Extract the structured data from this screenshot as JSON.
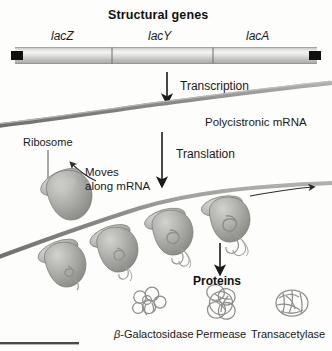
{
  "figure": {
    "title": "Structural genes",
    "genes": [
      {
        "label": "lacZ"
      },
      {
        "label": "lacY"
      },
      {
        "label": "lacA"
      }
    ],
    "steps": [
      {
        "label": "Transcription"
      },
      {
        "label": "Translation"
      }
    ],
    "mrna_label": "Polycistronic mRNA",
    "ribosome_label": "Ribosome",
    "moves_label_line1": "Moves",
    "moves_label_line2": "along mRNA",
    "proteins_label": "Proteins",
    "proteins": [
      {
        "prefix": "β",
        "name": "-Galactosidase"
      },
      {
        "prefix": "",
        "name": "Permease"
      },
      {
        "prefix": "",
        "name": "Transacetylase"
      }
    ],
    "colors": {
      "dna_bar_light": "#f2f2f0",
      "dna_bar_mid": "#c9c9c5",
      "dna_bar_dark": "#9a9a96",
      "dna_cap": "#111111",
      "mrna": "#8d8d89",
      "ribosome": "#a8a8a4",
      "ribosome_dark": "#8b8b87",
      "protein_outline": "#8e8e8a",
      "arrow": "#1a1a1a",
      "rule": "#4a4a48",
      "background": "#fdfdfc"
    }
  }
}
